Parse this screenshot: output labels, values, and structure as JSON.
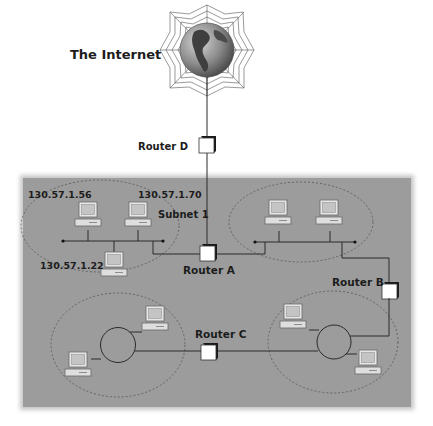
{
  "diagram": {
    "title": "The Internet",
    "colors": {
      "panel": "#9a9a9a",
      "panel_edge": "#b8b8b8",
      "line": "#2a2a2a",
      "globe_light": "#c8c8c8",
      "globe_dark": "#555555",
      "router_face": "#ffffff",
      "router_side": "#1a1a1a",
      "screen": "#c9c9c9"
    },
    "routers": [
      {
        "id": "D",
        "label": "Router D"
      },
      {
        "id": "A",
        "label": "Router A"
      },
      {
        "id": "B",
        "label": "Router B"
      },
      {
        "id": "C",
        "label": "Router C"
      }
    ],
    "subnets": [
      {
        "id": "subnet1",
        "label": "Subnet 1",
        "topology": "bus",
        "hosts": [
          {
            "ip": "130.57.1.56"
          },
          {
            "ip": "130.57.1.70"
          },
          {
            "ip": "130.57.1.22"
          }
        ]
      },
      {
        "id": "subnet2",
        "label": "",
        "topology": "bus",
        "hosts": [
          {
            "ip": ""
          },
          {
            "ip": ""
          }
        ]
      },
      {
        "id": "subnet3",
        "label": "",
        "topology": "ring",
        "hosts": [
          {
            "ip": ""
          },
          {
            "ip": ""
          }
        ]
      },
      {
        "id": "subnet4",
        "label": "",
        "topology": "ring",
        "hosts": [
          {
            "ip": ""
          },
          {
            "ip": ""
          }
        ]
      }
    ]
  }
}
